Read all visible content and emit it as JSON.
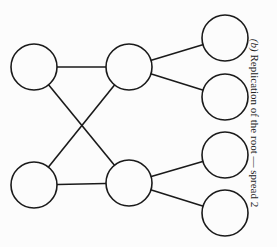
{
  "figure": {
    "caption_label": "(b)",
    "caption_text": "Replication of the root — spread 2"
  },
  "graph": {
    "node_radius": 23,
    "stroke_color": "#1a1a1a",
    "nodes": [
      {
        "id": "L1",
        "cx": 34,
        "cy": 67
      },
      {
        "id": "L2",
        "cx": 34,
        "cy": 185
      },
      {
        "id": "M1",
        "cx": 129,
        "cy": 67
      },
      {
        "id": "M2",
        "cx": 129,
        "cy": 183
      },
      {
        "id": "R1",
        "cx": 225,
        "cy": 38
      },
      {
        "id": "R2",
        "cx": 225,
        "cy": 97
      },
      {
        "id": "R3",
        "cx": 225,
        "cy": 155
      },
      {
        "id": "R4",
        "cx": 225,
        "cy": 213
      }
    ],
    "edges": [
      [
        "L1",
        "M1"
      ],
      [
        "L2",
        "M2"
      ],
      [
        "L1",
        "M2"
      ],
      [
        "L2",
        "M1"
      ],
      [
        "M1",
        "R1"
      ],
      [
        "M1",
        "R2"
      ],
      [
        "M2",
        "R3"
      ],
      [
        "M2",
        "R4"
      ]
    ]
  }
}
